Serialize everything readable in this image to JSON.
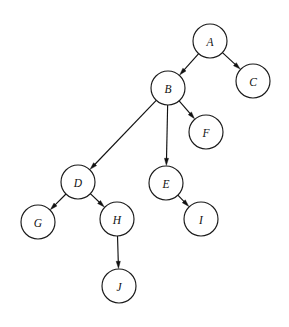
{
  "diagram": {
    "type": "directed-tree",
    "background_color": "#ffffff",
    "node_fill": "#ffffff",
    "node_stroke": "#1a1a1a",
    "edge_color": "#111111",
    "label_color": "#111111",
    "node_radius": 17,
    "nodes": [
      {
        "id": "A",
        "label": "A",
        "cx": 210,
        "cy": 41
      },
      {
        "id": "B",
        "label": "B",
        "cx": 168,
        "cy": 88
      },
      {
        "id": "C",
        "label": "C",
        "cx": 253,
        "cy": 81
      },
      {
        "id": "D",
        "label": "D",
        "cx": 78,
        "cy": 182
      },
      {
        "id": "E",
        "label": "E",
        "cx": 166,
        "cy": 183
      },
      {
        "id": "F",
        "label": "F",
        "cx": 206,
        "cy": 132
      },
      {
        "id": "G",
        "label": "G",
        "cx": 38,
        "cy": 222
      },
      {
        "id": "H",
        "label": "H",
        "cx": 117,
        "cy": 219
      },
      {
        "id": "I",
        "label": "I",
        "cx": 201,
        "cy": 219
      },
      {
        "id": "J",
        "label": "J",
        "cx": 119,
        "cy": 286
      }
    ],
    "edges": [
      {
        "id": "A-B",
        "from": "A",
        "to": "B",
        "directed": true
      },
      {
        "id": "A-C",
        "from": "A",
        "to": "C",
        "directed": true
      },
      {
        "id": "B-D",
        "from": "B",
        "to": "D",
        "directed": true
      },
      {
        "id": "B-E",
        "from": "B",
        "to": "E",
        "directed": true
      },
      {
        "id": "B-F",
        "from": "B",
        "to": "F",
        "directed": true
      },
      {
        "id": "D-G",
        "from": "D",
        "to": "G",
        "directed": true
      },
      {
        "id": "D-H",
        "from": "D",
        "to": "H",
        "directed": true
      },
      {
        "id": "E-I",
        "from": "E",
        "to": "I",
        "directed": true
      },
      {
        "id": "H-J",
        "from": "H",
        "to": "J",
        "directed": true
      }
    ]
  }
}
